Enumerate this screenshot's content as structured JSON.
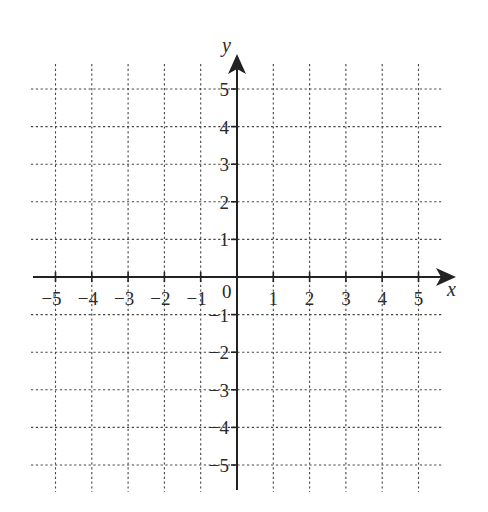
{
  "diagram": {
    "type": "coordinate-plane",
    "x_axis": {
      "label": "x",
      "min": -5,
      "max": 5,
      "ticks": [
        -5,
        -4,
        -3,
        -2,
        -1,
        1,
        2,
        3,
        4,
        5
      ]
    },
    "y_axis": {
      "label": "y",
      "min": -5,
      "max": 5,
      "ticks": [
        -5,
        -4,
        -3,
        -2,
        -1,
        1,
        2,
        3,
        4,
        5
      ]
    },
    "origin_label": "0",
    "x_tick_labels": [
      "−5",
      "−4",
      "−3",
      "−2",
      "−1",
      "1",
      "2",
      "3",
      "4",
      "5"
    ],
    "y_tick_labels": [
      "5",
      "4",
      "3",
      "2",
      "1",
      "−1",
      "−2",
      "−3",
      "−4",
      "−5"
    ],
    "grid": {
      "style": "dotted",
      "spacing": 1,
      "color": "#444444"
    },
    "axis_color": "#222222",
    "background": "#ffffff"
  }
}
